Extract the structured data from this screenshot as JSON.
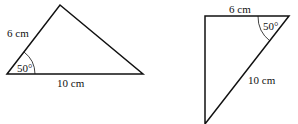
{
  "figures": [
    {
      "name": "triangle-left",
      "vertices": [
        [
          7,
          74
        ],
        [
          60,
          5
        ],
        [
          143,
          74
        ]
      ],
      "labels": {
        "side_a": "6 cm",
        "side_b": "10 cm",
        "angle": "50°"
      }
    },
    {
      "name": "triangle-right",
      "vertices": [
        [
          205,
          16
        ],
        [
          289,
          16
        ],
        [
          205,
          124
        ]
      ],
      "labels": {
        "side_a": "6 cm",
        "side_b": "10 cm",
        "angle": "50°"
      }
    }
  ],
  "colors": {
    "stroke": "#111111",
    "background": "#ffffff"
  }
}
